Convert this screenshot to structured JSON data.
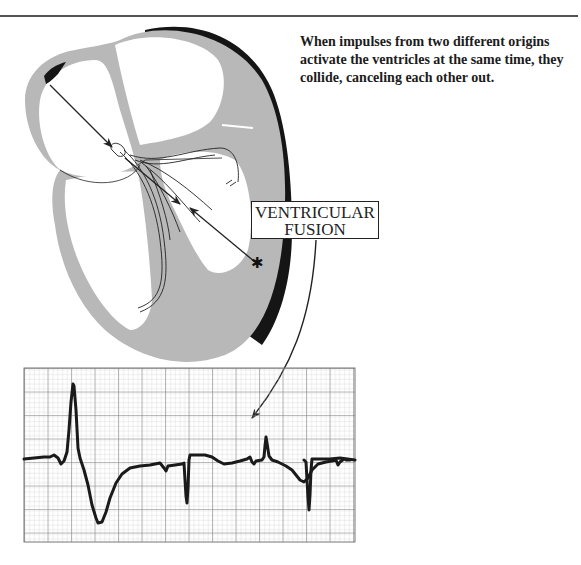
{
  "header": {
    "title_clipped": "VENTRICULAR FUSION"
  },
  "caption": {
    "text": "When impulses from two different origins activate the ventricles at the same time, they collide, canceling each other out."
  },
  "diagram": {
    "label_line1": "VENTRICULAR",
    "label_line2": "FUSION",
    "colors": {
      "myocardium": "#b8b8b8",
      "epicardium_dark": "#151515",
      "chamber": "#ffffff",
      "stroke": "#222222"
    },
    "ectopic_focus_symbol": "✱"
  },
  "ecg_strip": {
    "grid": {
      "x": 24,
      "y": 368,
      "width": 331,
      "height": 174,
      "minor_px": 4.7,
      "major_px": 23.5
    },
    "colors": {
      "grid_minor": "#c4c4c4",
      "grid_major": "#777777",
      "trace": "#1a1a1a"
    },
    "beats": [
      "PVC (wide, tall R, deep S)",
      "Normal sinus (negative QRS)",
      "Fusion beat (small R spike)",
      "Normal sinus (negative QRS)"
    ]
  }
}
